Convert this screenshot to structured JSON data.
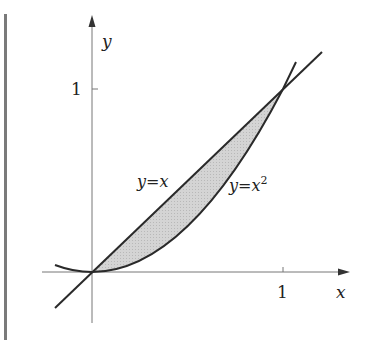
{
  "diagram": {
    "axes": {
      "x_label": "x",
      "y_label": "y",
      "x_tick_label": "1",
      "y_tick_label": "1"
    },
    "curves": [
      {
        "name": "line",
        "label": "y=x",
        "equation": "y = x"
      },
      {
        "name": "parabola",
        "label_base": "y=x",
        "label_sup": "2",
        "equation": "y = x^2"
      }
    ],
    "shaded_region": {
      "between": [
        "y = x",
        "y = x^2"
      ],
      "x_range": [
        0,
        1
      ],
      "fill": "#c8c8c8"
    },
    "intersections": [
      [
        0,
        0
      ],
      [
        1,
        1
      ]
    ],
    "colors": {
      "curve": "#2a2a2a",
      "axis": "#777777",
      "shade": "#c8c8c8",
      "margin_bar": "#7a7a7a"
    }
  }
}
